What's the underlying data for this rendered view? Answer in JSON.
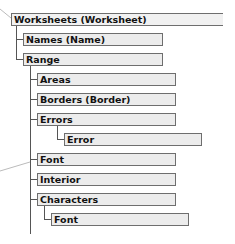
{
  "diagram": {
    "nodes": [
      {
        "id": "worksheets",
        "label": "Worksheets (Worksheet)",
        "level": 0
      },
      {
        "id": "names",
        "label": "Names (Name)",
        "level": 1,
        "parent": "worksheets"
      },
      {
        "id": "range",
        "label": "Range",
        "level": 1,
        "parent": "worksheets"
      },
      {
        "id": "areas",
        "label": "Areas",
        "level": 2,
        "parent": "range"
      },
      {
        "id": "borders",
        "label": "Borders (Border)",
        "level": 2,
        "parent": "range"
      },
      {
        "id": "errors",
        "label": "Errors",
        "level": 2,
        "parent": "range"
      },
      {
        "id": "error",
        "label": "Error",
        "level": 3,
        "parent": "errors"
      },
      {
        "id": "font",
        "label": "Font",
        "level": 2,
        "parent": "range"
      },
      {
        "id": "interior",
        "label": "Interior",
        "level": 2,
        "parent": "range"
      },
      {
        "id": "characters",
        "label": "Characters",
        "level": 2,
        "parent": "range"
      },
      {
        "id": "characters_font",
        "label": "Font",
        "level": 3,
        "parent": "characters"
      }
    ],
    "colors": {
      "box_fill": "#ececec",
      "box_border": "#6e6e6e",
      "connector": "#555555",
      "callout_line": "#bbbbbb"
    }
  }
}
